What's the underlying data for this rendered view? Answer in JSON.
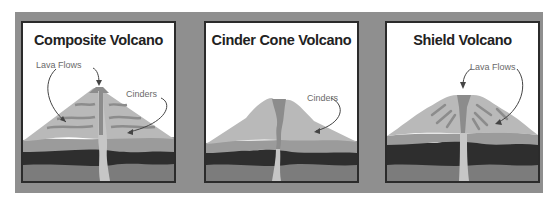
{
  "colors": {
    "backdrop": "#8f8f8f",
    "panel_bg": "#ffffff",
    "panel_border": "#2b2b2b",
    "cone_light": "#b9b9b9",
    "cone_mid": "#9b9b9b",
    "lava": "#8c8c8c",
    "conduit": "#c6c6c6",
    "dark_layer": "#2e2e2e",
    "bottom_layer": "#7c7c7c",
    "arrow": "#444444",
    "label_text": "#6a6a6a"
  },
  "panels": [
    {
      "title": "Composite Volcano",
      "labels": [
        "Lava Flows",
        "Cinders"
      ]
    },
    {
      "title": "Cinder Cone Volcano",
      "labels": [
        "Cinders"
      ]
    },
    {
      "title": "Shield Volcano",
      "labels": [
        "Lava Flows"
      ]
    }
  ]
}
